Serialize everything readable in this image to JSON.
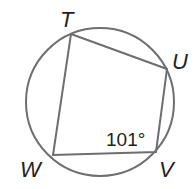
{
  "diagram": {
    "type": "inscribed-quadrilateral",
    "circle": {
      "cx": 100,
      "cy": 102,
      "r": 74
    },
    "vertices": {
      "T": {
        "label": "T",
        "x": 71,
        "y": 34
      },
      "U": {
        "label": "U",
        "x": 167,
        "y": 69
      },
      "V": {
        "label": "V",
        "x": 156,
        "y": 152
      },
      "W": {
        "label": "W",
        "x": 53,
        "y": 155
      }
    },
    "angle_label": "101°",
    "angle_at": "V",
    "stroke_color": "#6d6e71",
    "text_color": "#231f20"
  }
}
